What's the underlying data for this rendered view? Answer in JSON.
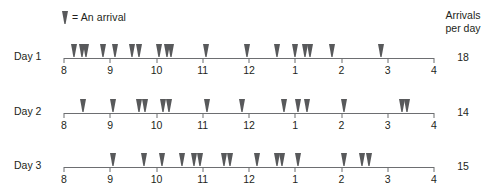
{
  "legend": {
    "marker_icon": "arrival-marker-icon",
    "text": "= An arrival"
  },
  "arrivals_header": {
    "line1": "Arrivals",
    "line2": "per day"
  },
  "axis": {
    "tick_labels": [
      "8",
      "9",
      "10",
      "11",
      "12",
      "1",
      "2",
      "3",
      "4"
    ],
    "marker_color": "#58595b",
    "line_color": "#6d6e71"
  },
  "rows": [
    {
      "label": "Day 1",
      "count": "18"
    },
    {
      "label": "Day 2",
      "count": "14"
    },
    {
      "label": "Day 3",
      "count": "15"
    }
  ],
  "chart_data": {
    "type": "scatter",
    "title": "",
    "subtitle": "",
    "xlabel": "",
    "ylabel": "",
    "legend_entries": [
      "= An arrival"
    ],
    "legend_position": "top-left",
    "grid": false,
    "axis_tick_labels": [
      "8",
      "9",
      "10",
      "11",
      "12",
      "1",
      "2",
      "3",
      "4"
    ],
    "axis_hours_elapsed": [
      0,
      1,
      2,
      3,
      4,
      5,
      6,
      7,
      8
    ],
    "xlim": [
      0,
      8
    ],
    "series": [
      {
        "name": "Day 1",
        "count": 18,
        "values": [
          0.22,
          0.38,
          0.47,
          0.85,
          1.1,
          1.48,
          1.62,
          2.05,
          2.23,
          2.32,
          3.08,
          3.95,
          4.6,
          5.0,
          5.2,
          5.32,
          5.8,
          6.85,
          7.25
        ]
      },
      {
        "name": "Day 2",
        "count": 14,
        "values": [
          0.42,
          1.05,
          1.62,
          1.76,
          2.15,
          2.28,
          3.1,
          3.85,
          4.75,
          5.05,
          5.25,
          6.05,
          7.3,
          7.42
        ]
      },
      {
        "name": "Day 3",
        "count": 15,
        "values": [
          1.05,
          1.72,
          2.12,
          2.55,
          2.82,
          2.95,
          3.45,
          3.58,
          4.18,
          4.6,
          4.72,
          5.05,
          6.05,
          6.45,
          6.6
        ]
      }
    ]
  },
  "marker_positions": {
    "day1": [
      0.22,
      0.38,
      0.47,
      0.85,
      1.1,
      1.48,
      1.62,
      2.05,
      2.23,
      2.32,
      3.08,
      3.95,
      4.6,
      5.0,
      5.2,
      5.32,
      5.8,
      6.85
    ],
    "day2": [
      0.42,
      1.05,
      1.62,
      1.76,
      2.15,
      2.28,
      3.1,
      3.85,
      4.75,
      5.05,
      5.25,
      6.05,
      7.3,
      7.42
    ],
    "day3": [
      1.05,
      1.72,
      2.12,
      2.55,
      2.82,
      2.95,
      3.45,
      3.58,
      4.18,
      4.6,
      4.72,
      5.05,
      6.05,
      6.45,
      6.6
    ]
  }
}
